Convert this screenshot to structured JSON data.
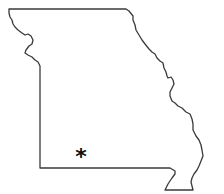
{
  "map": {
    "region": "Missouri",
    "outline_color": "#3a3a3a",
    "background_color": "#ffffff",
    "marker": {
      "symbol": "*",
      "icon": "asterisk-icon",
      "color": "#111111",
      "position": "southwest"
    }
  }
}
